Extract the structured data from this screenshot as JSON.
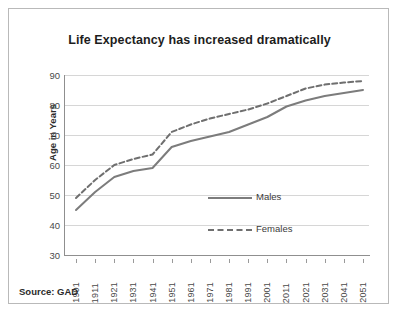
{
  "chart_data": {
    "type": "line",
    "title": "Life Expectancy has increased dramatically",
    "xlabel": "",
    "ylabel": "Age in Years",
    "ylim": [
      30,
      90
    ],
    "yticks": [
      30,
      40,
      50,
      60,
      70,
      80,
      90
    ],
    "grid": true,
    "legend_position": "center-right-inside",
    "categories": [
      1901,
      1911,
      1921,
      1931,
      1941,
      1951,
      1961,
      1971,
      1981,
      1991,
      2001,
      2011,
      2021,
      2031,
      2041,
      2051
    ],
    "series": [
      {
        "name": "Males",
        "style": "solid",
        "color": "#7c7c7c",
        "values": [
          45,
          51,
          56,
          58,
          59,
          66,
          68,
          69.5,
          71,
          73.5,
          76,
          79.5,
          81.5,
          83,
          84,
          85
        ]
      },
      {
        "name": "Females",
        "style": "dashed",
        "color": "#6f6f6f",
        "values": [
          49,
          55,
          60,
          62,
          63.5,
          71,
          73.5,
          75.5,
          77,
          78.5,
          80.5,
          83,
          85.5,
          86.8,
          87.5,
          88
        ]
      }
    ],
    "source_note": "Source: GAD"
  },
  "axis": {
    "y_tick_labels": [
      "90",
      "80",
      "70",
      "60",
      "50",
      "40",
      "30"
    ],
    "x_tick_labels": [
      "1901",
      "1911",
      "1921",
      "1931",
      "1941",
      "1951",
      "1961",
      "1971",
      "1981",
      "1991",
      "2001",
      "2011",
      "2021",
      "2031",
      "2041",
      "2051"
    ],
    "y_axis_title": "Age in Years"
  },
  "legend": {
    "items": [
      {
        "label": "Males"
      },
      {
        "label": "Females"
      }
    ]
  },
  "footer": {
    "source": "Source: GAD"
  },
  "colors": {
    "males_line": "#7c7c7c",
    "females_line": "#6f6f6f",
    "grid": "#d6d6d6",
    "axis": "#8f8f8f",
    "frame": "#b9b9b9",
    "text": "#2b2b2b"
  }
}
